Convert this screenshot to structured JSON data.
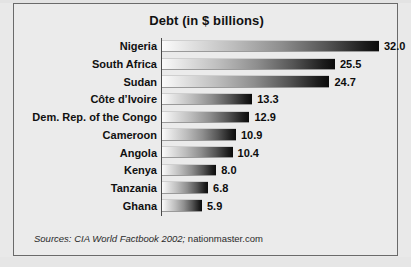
{
  "frame": {
    "background_color": "#e9e9e9",
    "panel_color": "#ebebeb",
    "border_color": "#6a6a6a"
  },
  "title": "Debt (in $ billions)",
  "source_note": {
    "italic_part": "Sources: CIA World Factbook 2002;",
    "roman_part": " nationmaster.com"
  },
  "chart_data": {
    "type": "bar",
    "orientation": "horizontal",
    "title": "Debt (in $ billions)",
    "xlabel": "",
    "ylabel": "",
    "xlim": [
      0,
      32.0
    ],
    "grid": false,
    "legend": false,
    "value_format": "one-decimal",
    "bar_gradient": [
      "#fbfbfb",
      "#0b0b0b"
    ],
    "categories": [
      "Nigeria",
      "South Africa",
      "Sudan",
      "Côte d’Ivoire",
      "Dem. Rep. of the Congo",
      "Cameroon",
      "Angola",
      "Kenya",
      "Tanzania",
      "Ghana"
    ],
    "values": [
      32.0,
      25.5,
      24.7,
      13.3,
      12.9,
      10.9,
      10.4,
      8.0,
      6.8,
      5.9
    ],
    "value_labels": [
      "32.0",
      "25.5",
      "24.7",
      "13.3",
      "12.9",
      "10.9",
      "10.4",
      "8.0",
      "6.8",
      "5.9"
    ]
  }
}
